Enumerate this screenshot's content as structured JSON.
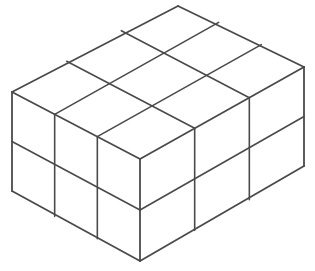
{
  "figure": {
    "type": "isometric-diagram",
    "alt_text": "Isometric drawing of a 3 by 3 by 2 rectangular arrangement of cubes"
  },
  "style": {
    "background_color": "#ffffff",
    "line_color": "#4a4a4a",
    "face_color": "#ffffff",
    "line_width": 1.6
  },
  "geometry": {
    "units": {
      "width_cubes": 3,
      "depth_cubes": 3,
      "height_cubes": 2,
      "total_cubes": 18
    },
    "origin_front_top": {
      "x": 140,
      "y": 159
    },
    "origin_front_bottom": {
      "x": 140,
      "y": 261
    },
    "vertex_left_top": {
      "x": 12,
      "y": 92
    },
    "vertex_apex_top": {
      "x": 178,
      "y": 6
    },
    "vertex_right_top": {
      "x": 304,
      "y": 67
    },
    "vertex_left_bottom": {
      "x": 12,
      "y": 191
    },
    "vertex_right_bottom": {
      "x": 304,
      "y": 166
    },
    "axis_left_step": {
      "dx": -42.667,
      "dy": -22.333
    },
    "axis_right_step": {
      "dx": 54.667,
      "dy": -30.667
    },
    "axis_down_step": {
      "dx": 0,
      "dy": 51
    }
  },
  "faces": {
    "top": {
      "label": "top-face",
      "grid_cols": 3,
      "grid_rows": 3,
      "visible_cells": 9
    },
    "left": {
      "label": "left-face",
      "grid_cols": 3,
      "grid_rows": 2,
      "visible_cells": 6
    },
    "right": {
      "label": "right-face",
      "grid_cols": 3,
      "grid_rows": 2,
      "visible_cells": 6
    }
  }
}
